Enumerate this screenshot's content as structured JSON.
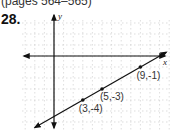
{
  "header": {
    "pages_text": "(pages 564–565)",
    "problem_number": "28."
  },
  "chart_data": {
    "type": "line",
    "title": "",
    "xlabel": "x",
    "ylabel": "y",
    "grid": true,
    "points": [
      {
        "x": 3,
        "y": -4,
        "label": "(3,-4)"
      },
      {
        "x": 5,
        "y": -3,
        "label": "(5,-3)"
      },
      {
        "x": 9,
        "y": -1,
        "label": "(9,-1)"
      }
    ],
    "line": {
      "slope": 0.5,
      "intercept": -5.5,
      "arrows": "both"
    },
    "xlim": [
      -4,
      12
    ],
    "ylim": [
      -7,
      4
    ]
  }
}
